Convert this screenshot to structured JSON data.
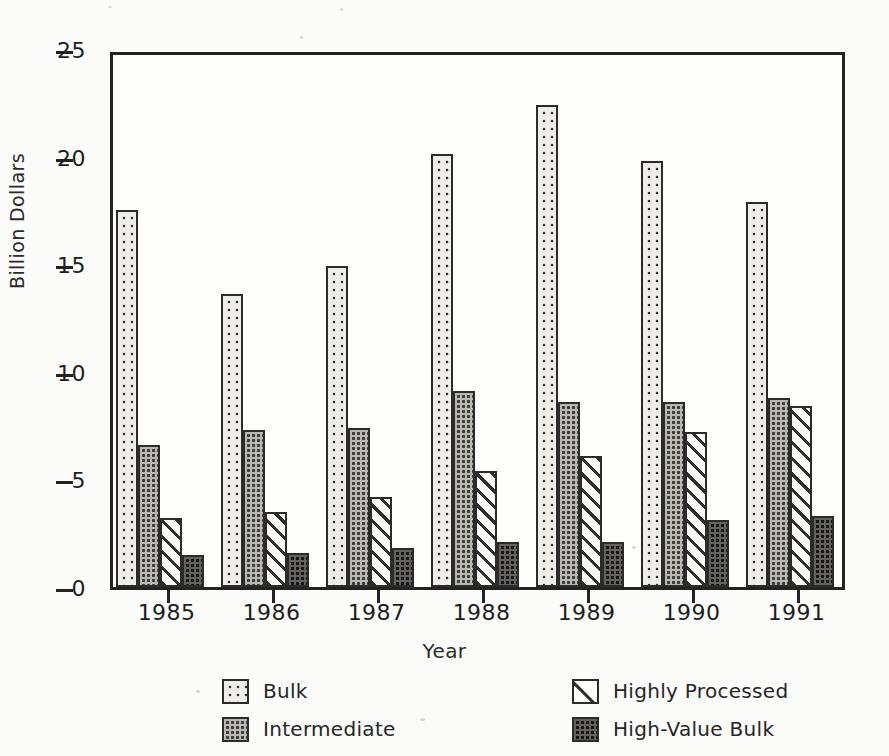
{
  "chart_data": {
    "type": "bar",
    "title": "",
    "xlabel": "Year",
    "ylabel": "Billion Dollars",
    "categories": [
      "1985",
      "1986",
      "1987",
      "1988",
      "1989",
      "1990",
      "1991"
    ],
    "ylim": [
      0,
      25
    ],
    "yticks": [
      0,
      5,
      10,
      15,
      20,
      25
    ],
    "ytick_labels": [
      "0",
      "5",
      "10",
      "15",
      "20",
      "25"
    ],
    "grid": false,
    "legend_position": "bottom",
    "series": [
      {
        "name": "Bulk",
        "pattern": "light-dotted",
        "values": [
          17.5,
          13.6,
          14.9,
          20.1,
          22.4,
          19.8,
          17.9
        ]
      },
      {
        "name": "Intermediate",
        "pattern": "gray-dotted",
        "values": [
          6.6,
          7.3,
          7.4,
          9.1,
          8.6,
          8.6,
          8.8
        ]
      },
      {
        "name": "Highly Processed",
        "pattern": "diagonal-hatch",
        "values": [
          3.2,
          3.5,
          4.2,
          5.4,
          6.1,
          7.2,
          8.4
        ]
      },
      {
        "name": "High-Value Bulk",
        "pattern": "dark-dotted",
        "values": [
          1.5,
          1.6,
          1.8,
          2.1,
          2.1,
          3.1,
          3.3
        ]
      }
    ]
  },
  "legend": {
    "items": [
      {
        "label": "Bulk"
      },
      {
        "label": "Intermediate"
      },
      {
        "label": "Highly Processed"
      },
      {
        "label": "High-Value Bulk"
      }
    ]
  },
  "colors": {
    "axis": "#232323",
    "bar_outline": "#2b2b2b",
    "bulk_fill": "#f0eeea",
    "intermediate_fill": "#b9b7b2",
    "highly_processed_fill": "#fbfaf7",
    "high_value_bulk_fill": "#636260",
    "background": "#fbfbfa",
    "text": "#1d1d1d"
  }
}
